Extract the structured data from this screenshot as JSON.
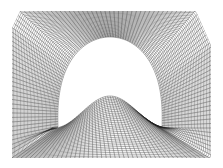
{
  "figure": {
    "type": "structured-mesh",
    "background": "#ffffff",
    "line_color": "#222222",
    "width": 223,
    "height": 168
  },
  "outer_boundary": [
    [
      20,
      11
    ],
    [
      196,
      11
    ],
    [
      211,
      45
    ],
    [
      211,
      158
    ],
    [
      12,
      158
    ],
    [
      12,
      28
    ]
  ],
  "inner_boundary": {
    "apex": [
      110,
      37
    ],
    "left_cusp": [
      50,
      128
    ],
    "right_cusp": [
      162,
      128
    ],
    "bump_peak": [
      110,
      96
    ]
  },
  "grid": {
    "radial_lines": 150,
    "circumferential_lines": 34
  }
}
